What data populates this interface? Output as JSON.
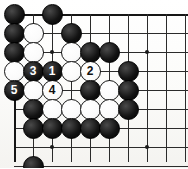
{
  "figure": {
    "type": "go-board-diagram",
    "title": "",
    "board_background": "#fdfdfb",
    "line_color": "#2b2b2b",
    "black_color": "#000000",
    "white_color": "#ffffff"
  },
  "board": {
    "origin_x": 14,
    "origin_y": 14,
    "spacing": 19,
    "cols": 9,
    "rows": 8,
    "left_edge": true,
    "top_edge": true,
    "hoshi": [
      {
        "col": 2,
        "row": 2
      },
      {
        "col": 7,
        "row": 2
      },
      {
        "col": 2,
        "row": 7
      },
      {
        "col": 7,
        "row": 7
      }
    ]
  },
  "stones": [
    {
      "col": 0,
      "row": 0,
      "color": "black",
      "label": ""
    },
    {
      "col": 2,
      "row": 0,
      "color": "black",
      "label": ""
    },
    {
      "col": 0,
      "row": 1,
      "color": "black",
      "label": ""
    },
    {
      "col": 1,
      "row": 1,
      "color": "white",
      "label": ""
    },
    {
      "col": 3,
      "row": 1,
      "color": "black",
      "label": ""
    },
    {
      "col": 0,
      "row": 2,
      "color": "black",
      "label": ""
    },
    {
      "col": 1,
      "row": 2,
      "color": "white",
      "label": ""
    },
    {
      "col": 3,
      "row": 2,
      "color": "white",
      "label": ""
    },
    {
      "col": 4,
      "row": 2,
      "color": "black",
      "label": ""
    },
    {
      "col": 5,
      "row": 2,
      "color": "black",
      "label": ""
    },
    {
      "col": 0,
      "row": 3,
      "color": "white",
      "label": ""
    },
    {
      "col": 1,
      "row": 3,
      "color": "black",
      "label": "3"
    },
    {
      "col": 2,
      "row": 3,
      "color": "black",
      "label": "1"
    },
    {
      "col": 3,
      "row": 3,
      "color": "white",
      "label": ""
    },
    {
      "col": 4,
      "row": 3,
      "color": "white",
      "label": "2"
    },
    {
      "col": 6,
      "row": 3,
      "color": "black",
      "label": ""
    },
    {
      "col": 0,
      "row": 4,
      "color": "black",
      "label": "5"
    },
    {
      "col": 1,
      "row": 4,
      "color": "white",
      "label": ""
    },
    {
      "col": 2,
      "row": 4,
      "color": "white",
      "label": "4"
    },
    {
      "col": 4,
      "row": 4,
      "color": "black",
      "label": ""
    },
    {
      "col": 5,
      "row": 4,
      "color": "white",
      "label": ""
    },
    {
      "col": 6,
      "row": 4,
      "color": "black",
      "label": ""
    },
    {
      "col": 1,
      "row": 5,
      "color": "black",
      "label": ""
    },
    {
      "col": 2,
      "row": 5,
      "color": "white",
      "label": ""
    },
    {
      "col": 3,
      "row": 5,
      "color": "white",
      "label": ""
    },
    {
      "col": 4,
      "row": 5,
      "color": "white",
      "label": ""
    },
    {
      "col": 5,
      "row": 5,
      "color": "white",
      "label": ""
    },
    {
      "col": 6,
      "row": 5,
      "color": "black",
      "label": ""
    },
    {
      "col": 1,
      "row": 6,
      "color": "black",
      "label": ""
    },
    {
      "col": 2,
      "row": 6,
      "color": "black",
      "label": ""
    },
    {
      "col": 3,
      "row": 6,
      "color": "black",
      "label": ""
    },
    {
      "col": 4,
      "row": 6,
      "color": "black",
      "label": ""
    },
    {
      "col": 5,
      "row": 6,
      "color": "black",
      "label": ""
    },
    {
      "col": 1,
      "row": 8,
      "color": "black",
      "label": ""
    }
  ],
  "move_sequence": [
    {
      "number": "1",
      "color": "black"
    },
    {
      "number": "2",
      "color": "white"
    },
    {
      "number": "3",
      "color": "black"
    },
    {
      "number": "4",
      "color": "white"
    },
    {
      "number": "5",
      "color": "black"
    }
  ]
}
